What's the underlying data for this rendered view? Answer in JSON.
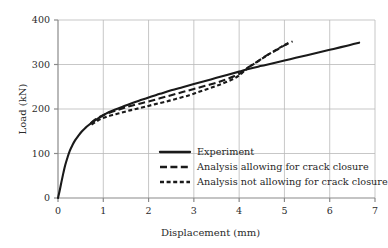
{
  "chart_data": {
    "type": "line",
    "title": "",
    "xlabel": "Displacement  (mm)",
    "ylabel": "Load (kN)",
    "xlim": [
      0,
      7
    ],
    "ylim": [
      0,
      400
    ],
    "xticks": [
      "0",
      "1",
      "2",
      "3",
      "4",
      "5",
      "6",
      "7"
    ],
    "yticks": [
      "0",
      "100",
      "200",
      "300",
      "400"
    ],
    "xtick_values": [
      0,
      1,
      2,
      3,
      4,
      5,
      6,
      7
    ],
    "ytick_values": [
      0,
      100,
      200,
      300,
      400
    ],
    "grid": true,
    "grid_color": "#b9b9b9",
    "legend_position": "lower-center-right",
    "line_color": "#1a1a1a",
    "series": [
      {
        "name": "Experiment",
        "style": "solid",
        "points": [
          [
            0.0,
            0
          ],
          [
            0.04,
            18
          ],
          [
            0.08,
            38
          ],
          [
            0.12,
            57
          ],
          [
            0.16,
            74
          ],
          [
            0.21,
            91
          ],
          [
            0.26,
            106
          ],
          [
            0.32,
            119
          ],
          [
            0.38,
            130
          ],
          [
            0.45,
            140
          ],
          [
            0.52,
            149
          ],
          [
            0.6,
            157
          ],
          [
            0.68,
            164
          ],
          [
            0.77,
            171
          ],
          [
            0.86,
            177
          ],
          [
            0.95,
            183
          ],
          [
            1.05,
            189
          ],
          [
            1.2,
            196
          ],
          [
            1.4,
            204
          ],
          [
            1.6,
            212
          ],
          [
            1.8,
            219
          ],
          [
            2.0,
            226
          ],
          [
            2.25,
            234
          ],
          [
            2.5,
            242
          ],
          [
            2.75,
            249
          ],
          [
            3.0,
            256
          ],
          [
            3.25,
            263
          ],
          [
            3.5,
            270
          ],
          [
            3.75,
            277
          ],
          [
            4.0,
            284
          ],
          [
            4.25,
            291
          ],
          [
            4.5,
            297
          ],
          [
            4.75,
            303
          ],
          [
            5.0,
            309
          ],
          [
            5.25,
            315
          ],
          [
            5.5,
            321
          ],
          [
            5.75,
            327
          ],
          [
            6.0,
            333
          ],
          [
            6.25,
            339
          ],
          [
            6.45,
            344
          ],
          [
            6.65,
            349
          ]
        ]
      },
      {
        "name": "Analysis allowing for crack closure",
        "style": "long-dash",
        "points": [
          [
            0.72,
            168
          ],
          [
            0.82,
            176
          ],
          [
            0.92,
            182
          ],
          [
            1.02,
            187
          ],
          [
            1.15,
            192
          ],
          [
            1.3,
            197
          ],
          [
            1.45,
            202
          ],
          [
            1.6,
            207
          ],
          [
            1.8,
            212
          ],
          [
            2.0,
            217
          ],
          [
            2.25,
            224
          ],
          [
            2.5,
            231
          ],
          [
            2.75,
            238
          ],
          [
            3.0,
            245
          ],
          [
            3.25,
            252
          ],
          [
            3.5,
            259
          ],
          [
            3.7,
            266
          ],
          [
            3.9,
            274
          ],
          [
            4.05,
            282
          ],
          [
            4.15,
            290
          ],
          [
            4.3,
            300
          ],
          [
            4.45,
            310
          ],
          [
            4.6,
            320
          ],
          [
            4.8,
            331
          ],
          [
            5.0,
            343
          ],
          [
            5.18,
            352
          ]
        ]
      },
      {
        "name": "Analysis not allowing for crack closure",
        "style": "short-dash",
        "points": [
          [
            0.74,
            165
          ],
          [
            0.85,
            172
          ],
          [
            0.95,
            178
          ],
          [
            1.08,
            183
          ],
          [
            1.22,
            187
          ],
          [
            1.38,
            191
          ],
          [
            1.55,
            196
          ],
          [
            1.72,
            200
          ],
          [
            1.92,
            205
          ],
          [
            2.15,
            211
          ],
          [
            2.4,
            217
          ],
          [
            2.65,
            224
          ],
          [
            2.9,
            231
          ],
          [
            3.1,
            238
          ],
          [
            3.3,
            245
          ],
          [
            3.5,
            252
          ],
          [
            3.7,
            260
          ],
          [
            3.88,
            268
          ],
          [
            4.02,
            277
          ],
          [
            4.12,
            286
          ],
          [
            4.25,
            296
          ],
          [
            4.4,
            306
          ],
          [
            4.55,
            316
          ],
          [
            4.72,
            327
          ],
          [
            4.92,
            339
          ],
          [
            5.1,
            349
          ]
        ]
      }
    ]
  },
  "legend": {
    "items": [
      {
        "label": "Experiment",
        "style": "solid"
      },
      {
        "label": "Analysis allowing for crack closure",
        "style": "long-dash"
      },
      {
        "label": "Analysis not allowing for crack closure",
        "style": "short-dash"
      }
    ]
  }
}
